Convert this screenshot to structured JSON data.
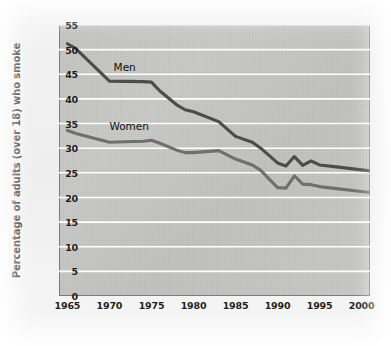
{
  "figure": {
    "caption_visible": false,
    "background_color": "#f2f2f2",
    "plot_background_color": "#c5c5c3",
    "plot_border_color": "#7d7d7d",
    "gridline_color": "#ffffff"
  },
  "chart_data": {
    "type": "line",
    "title": "",
    "xlabel": "",
    "ylabel": "Percentage of adults (over 18) who smoke",
    "xlim": [
      1964,
      2001
    ],
    "ylim": [
      0,
      55
    ],
    "grid": "horizontal",
    "legend_position": "inline-labels",
    "y_ticks": [
      0,
      5,
      10,
      15,
      20,
      25,
      30,
      35,
      40,
      45,
      50,
      55
    ],
    "x_ticks": [
      1965,
      1970,
      1975,
      1980,
      1985,
      1990,
      1995,
      2000
    ],
    "x": [
      1965,
      1966,
      1970,
      1974,
      1975,
      1976,
      1978,
      1979,
      1980,
      1983,
      1985,
      1987,
      1988,
      1990,
      1991,
      1992,
      1993,
      1994,
      1995,
      1997,
      2000,
      2001
    ],
    "series": [
      {
        "name": "Men",
        "color": "#4c4c4c",
        "label_x": 1970.5,
        "label_y": 46.2,
        "values": [
          51.2,
          50.2,
          43.6,
          43.5,
          43.4,
          41.6,
          38.8,
          37.8,
          37.4,
          35.4,
          32.4,
          31.2,
          30.0,
          27.0,
          26.4,
          28.3,
          26.5,
          27.4,
          26.6,
          26.2,
          25.6,
          25.4
        ]
      },
      {
        "name": "Women",
        "color": "#6f6f6f",
        "label_x": 1970.0,
        "label_y": 34.4,
        "values": [
          33.6,
          33.0,
          31.2,
          31.4,
          31.6,
          31.0,
          29.6,
          29.1,
          29.1,
          29.5,
          27.8,
          26.6,
          25.5,
          22.0,
          21.9,
          24.4,
          22.7,
          22.6,
          22.2,
          21.8,
          21.2,
          21.0
        ]
      }
    ]
  }
}
